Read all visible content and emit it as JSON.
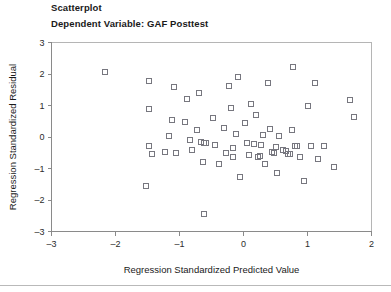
{
  "figure": {
    "title": "Scatterplot",
    "subtitle": "Dependent Variable: GAF Posttest"
  },
  "chart_data": {
    "type": "scatter",
    "title": "Scatterplot",
    "subtitle": "Dependent Variable: GAF Posttest",
    "xlabel": "Regression Standardized Predicted Value",
    "ylabel": "Regression Standardized Residual",
    "xlim": [
      -3,
      2
    ],
    "ylim": [
      -3,
      3
    ],
    "xticks": [
      -3,
      -2,
      -1,
      0,
      1,
      2
    ],
    "xticklabels": [
      "-3",
      "-2",
      "-1",
      "0",
      "1",
      "2"
    ],
    "yticks": [
      -3,
      -2,
      -1,
      0,
      1,
      2,
      3
    ],
    "yticklabels": [
      "-3",
      "-2",
      "-1",
      "0",
      "1",
      "2",
      "3"
    ],
    "grid": false,
    "legend": "none",
    "marker": "open-square",
    "marker_color": "#77777f",
    "n_points": 70,
    "points": [
      [
        -2.16,
        2.06
      ],
      [
        -1.47,
        1.78
      ],
      [
        -1.47,
        0.9
      ],
      [
        -1.47,
        -0.3
      ],
      [
        -1.43,
        -0.55
      ],
      [
        -1.52,
        -1.56
      ],
      [
        -1.09,
        1.59
      ],
      [
        -1.12,
        0.55
      ],
      [
        -1.16,
        0.03
      ],
      [
        -1.22,
        -0.49
      ],
      [
        -1.05,
        -0.52
      ],
      [
        -0.92,
        0.47
      ],
      [
        -0.88,
        1.22
      ],
      [
        -0.84,
        -0.08
      ],
      [
        -0.81,
        -0.4
      ],
      [
        -0.7,
        1.41
      ],
      [
        -0.72,
        0.22
      ],
      [
        -0.66,
        -0.15
      ],
      [
        -0.62,
        -0.18
      ],
      [
        -0.59,
        -0.19
      ],
      [
        -0.64,
        -0.8
      ],
      [
        -0.61,
        -2.45
      ],
      [
        -0.47,
        0.61
      ],
      [
        -0.44,
        -0.25
      ],
      [
        -0.38,
        -0.86
      ],
      [
        -0.31,
        0.3
      ],
      [
        -0.28,
        -0.52
      ],
      [
        -0.22,
        1.62
      ],
      [
        -0.2,
        0.92
      ],
      [
        -0.17,
        -0.34
      ],
      [
        -0.16,
        -0.62
      ],
      [
        -0.12,
        0.08
      ],
      [
        -0.09,
        1.9
      ],
      [
        -0.06,
        -1.28
      ],
      [
        0.02,
        0.44
      ],
      [
        0.05,
        -0.18
      ],
      [
        0.08,
        -0.58
      ],
      [
        0.11,
        1.06
      ],
      [
        0.16,
        -0.21
      ],
      [
        0.2,
        0.69
      ],
      [
        0.22,
        -0.62
      ],
      [
        0.25,
        -0.6
      ],
      [
        0.28,
        -0.25
      ],
      [
        0.31,
        0.05
      ],
      [
        0.34,
        -0.86
      ],
      [
        0.38,
        1.72
      ],
      [
        0.41,
        0.24
      ],
      [
        0.44,
        -0.48
      ],
      [
        0.47,
        -0.51
      ],
      [
        0.5,
        -0.31
      ],
      [
        0.53,
        -1.14
      ],
      [
        0.56,
        0.02
      ],
      [
        0.62,
        -0.42
      ],
      [
        0.66,
        -0.44
      ],
      [
        0.69,
        -0.55
      ],
      [
        0.72,
        -0.53
      ],
      [
        0.75,
        0.22
      ],
      [
        0.78,
        2.22
      ],
      [
        0.81,
        -0.28
      ],
      [
        0.84,
        -0.3
      ],
      [
        0.88,
        -0.63
      ],
      [
        0.94,
        -1.4
      ],
      [
        1.0,
        1.0
      ],
      [
        1.06,
        -0.3
      ],
      [
        1.12,
        1.72
      ],
      [
        1.16,
        -0.7
      ],
      [
        1.25,
        -0.3
      ],
      [
        1.41,
        -0.96
      ],
      [
        1.66,
        1.18
      ],
      [
        1.72,
        0.62
      ]
    ]
  }
}
